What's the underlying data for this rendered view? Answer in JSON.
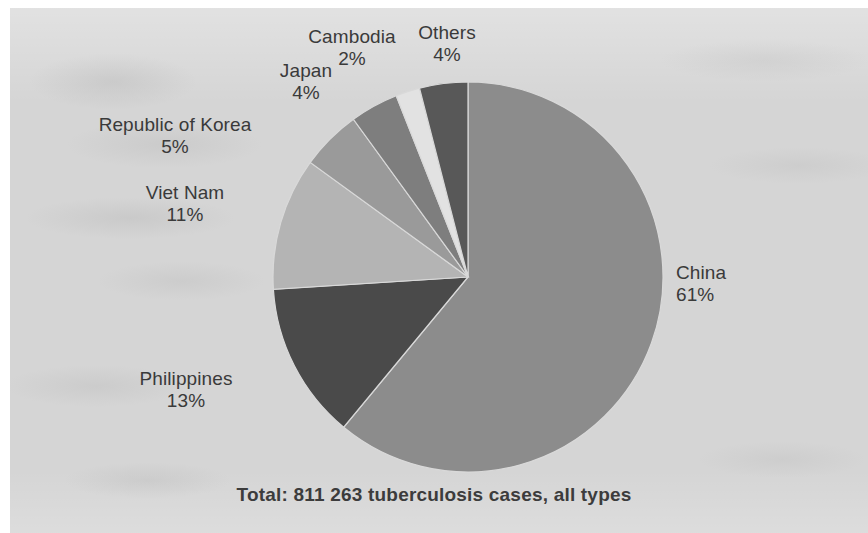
{
  "figure": {
    "caption": "Total: 811 263 tuberculosis cases, all types",
    "background_color": "#d5d5d5",
    "page_color": "#ffffff",
    "label_color": "#3a3a3a"
  },
  "labels": {
    "china": {
      "name": "China",
      "pct": "61%"
    },
    "philippines": {
      "name": "Philippines",
      "pct": "13%"
    },
    "viet_nam": {
      "name": "Viet Nam",
      "pct": "11%"
    },
    "korea": {
      "name": "Republic of Korea",
      "pct": "5%"
    },
    "japan": {
      "name": "Japan",
      "pct": "4%"
    },
    "cambodia": {
      "name": "Cambodia",
      "pct": "2%"
    },
    "others": {
      "name": "Others",
      "pct": "4%"
    }
  },
  "chart_data": {
    "type": "pie",
    "title": "",
    "subtitle": "",
    "annotation": "Total: 811 263 tuberculosis cases, all types",
    "total_label": "Total: 811 263 tuberculosis cases, all types",
    "total_value": 811263,
    "unit": "tuberculosis cases, all types",
    "legend_position": "labels-around-slices",
    "grid": false,
    "start_angle_deg": 0,
    "direction": "clockwise",
    "center": {
      "x": 468,
      "y": 277
    },
    "radius": 195,
    "categories": [
      "China",
      "Philippines",
      "Viet Nam",
      "Republic of Korea",
      "Japan",
      "Cambodia",
      "Others"
    ],
    "values": [
      61,
      13,
      11,
      5,
      4,
      2,
      4
    ],
    "value_labels": [
      "61%",
      "13%",
      "11%",
      "5%",
      "4%",
      "2%",
      "4%"
    ],
    "colors": [
      "#8c8c8c",
      "#4a4a4a",
      "#b4b4b4",
      "#9a9a9a",
      "#7e7e7e",
      "#e2e2e2",
      "#585858"
    ],
    "slices": [
      {
        "label": "China",
        "value": 61,
        "value_label": "61%",
        "color": "#8c8c8c"
      },
      {
        "label": "Philippines",
        "value": 13,
        "value_label": "13%",
        "color": "#4a4a4a"
      },
      {
        "label": "Viet Nam",
        "value": 11,
        "value_label": "11%",
        "color": "#b4b4b4"
      },
      {
        "label": "Republic of Korea",
        "value": 5,
        "value_label": "5%",
        "color": "#9a9a9a"
      },
      {
        "label": "Japan",
        "value": 4,
        "value_label": "4%",
        "color": "#7e7e7e"
      },
      {
        "label": "Cambodia",
        "value": 2,
        "value_label": "2%",
        "color": "#e2e2e2"
      },
      {
        "label": "Others",
        "value": 4,
        "value_label": "4%",
        "color": "#585858"
      }
    ],
    "label_positions": [
      {
        "label": "China",
        "x": 676,
        "y": 262,
        "align": "left"
      },
      {
        "label": "Philippines",
        "x": 186,
        "y": 368,
        "align": "center"
      },
      {
        "label": "Viet Nam",
        "x": 185,
        "y": 182,
        "align": "center"
      },
      {
        "label": "Republic of Korea",
        "x": 175,
        "y": 114,
        "align": "center"
      },
      {
        "label": "Japan",
        "x": 306,
        "y": 60,
        "align": "center"
      },
      {
        "label": "Cambodia",
        "x": 352,
        "y": 26,
        "align": "center"
      },
      {
        "label": "Others",
        "x": 447,
        "y": 22,
        "align": "center"
      }
    ]
  }
}
